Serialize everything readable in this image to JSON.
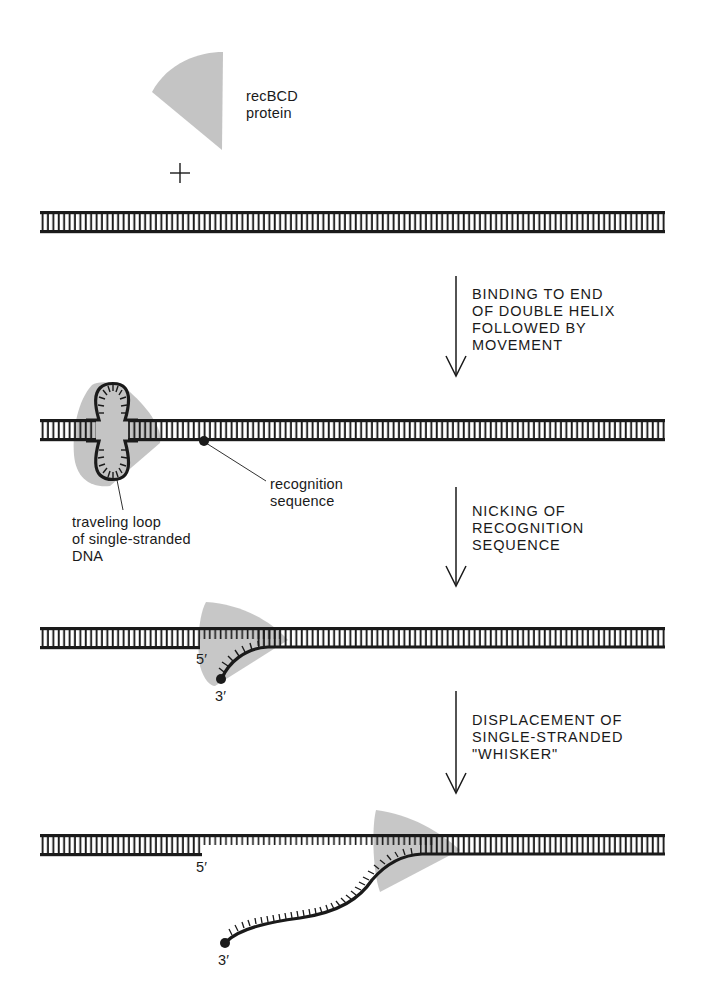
{
  "diagram": {
    "type": "process",
    "colors": {
      "ink": "#1a1a1a",
      "protein_fill": "#c4c4c4",
      "background": "#ffffff"
    },
    "labels": {
      "protein": "recBCD\nprotein",
      "plus": "+",
      "recognition_sequence": "recognition\nsequence",
      "traveling_loop": "traveling loop\nof single-stranded\nDNA",
      "five_prime_stage3": "5′",
      "three_prime_stage3": "3′",
      "five_prime_stage4": "5′",
      "three_prime_stage4": "3′"
    },
    "steps": [
      {
        "id": 1,
        "label": "BINDING TO END\nOF DOUBLE HELIX\nFOLLOWED BY\nMOVEMENT"
      },
      {
        "id": 2,
        "label": "NICKING OF\nRECOGNITION\nSEQUENCE"
      },
      {
        "id": 3,
        "label": "DISPLACEMENT OF\nSINGLE-STRANDED\n\"WHISKER\""
      }
    ],
    "stages": [
      {
        "id": 1,
        "content": "recBCD protein + intact DNA double helix"
      },
      {
        "id": 2,
        "content": "protein travels along helix with loop of single-stranded DNA; recognition sequence marked"
      },
      {
        "id": 3,
        "content": "strand nicked at recognition sequence; 5′ and 3′ ends"
      },
      {
        "id": 4,
        "content": "single-stranded whisker displaced with 3′ end free"
      }
    ]
  }
}
